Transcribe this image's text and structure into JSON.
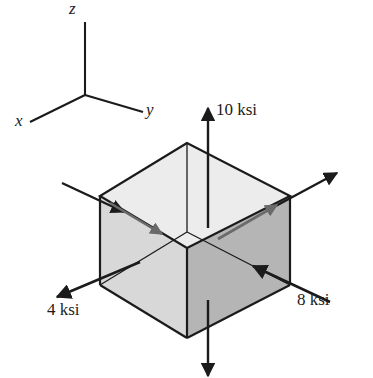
{
  "figure": {
    "type": "stress-element-diagram",
    "colors": {
      "stroke": "#1b1b1b",
      "top_face": "#ececec",
      "left_face": "#d8d8d8",
      "right_face": "#b5b5b5",
      "bottom_face": "#d2d2d2",
      "background": "#ffffff"
    }
  },
  "axes": {
    "z_label": "z",
    "x_label": "x",
    "y_label": "y"
  },
  "stresses": [
    {
      "id": "normal-z",
      "label": "10 ksi",
      "value": 10,
      "unit": "ksi",
      "direction": "up"
    },
    {
      "id": "normal-y",
      "label": "8 ksi",
      "value": 8,
      "unit": "ksi",
      "direction": "into-right-face"
    },
    {
      "id": "normal-x",
      "label": "4 ksi",
      "value": 4,
      "unit": "ksi",
      "direction": "out-lower-left"
    }
  ]
}
